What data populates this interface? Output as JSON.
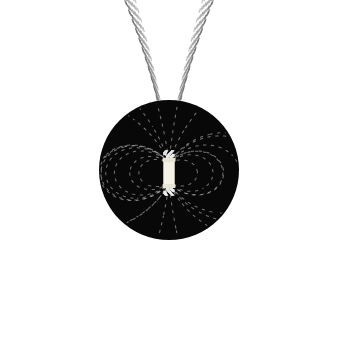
{
  "figure": {
    "caption": "",
    "background_color": "#ffffff"
  },
  "chart_data": {
    "type": "scatter",
    "subtitle": "",
    "xlabel": "",
    "ylabel": "",
    "xlim": [
      0,
      341
    ],
    "ylim": [
      0,
      339
    ],
    "grid": false,
    "legend_position": "none",
    "tick_labels_x": [],
    "tick_labels_y": [],
    "annotations": [],
    "geometry": {
      "disk_center_x": 169,
      "disk_center_y": 170,
      "disk_radius": 70,
      "disk_fill": "#080808",
      "magnet_center_x": 169,
      "magnet_center_y": 173,
      "magnet_width": 11,
      "magnet_height": 27,
      "magnet_fill": "#f4f1e6",
      "outer_dash_color": "#8b8b8b",
      "inner_dash_color": "#efefef",
      "dash_length": 5,
      "dash_gap": 5
    },
    "series": [
      {
        "name": "outer-field-loops",
        "kind": "closed-dipole-loops",
        "count": 11,
        "strength_values": [
          0.18,
          0.26,
          0.36,
          0.48,
          0.62,
          0.78,
          0.95,
          1.14,
          1.35,
          1.6,
          1.9
        ],
        "max_extent_x": 326,
        "min_extent_x": 16
      },
      {
        "name": "polar-escape-lines",
        "kind": "open-radial-lines",
        "count": 14,
        "angles_deg": [
          -78,
          -66,
          -54,
          -42,
          -30,
          -18,
          -6,
          6,
          18,
          30,
          42,
          54,
          66,
          78
        ]
      },
      {
        "name": "inner-filings-north",
        "kind": "radial-fan",
        "count": 120,
        "polarity": "north"
      },
      {
        "name": "inner-filings-south",
        "kind": "radial-fan",
        "count": 120,
        "polarity": "south"
      }
    ]
  }
}
